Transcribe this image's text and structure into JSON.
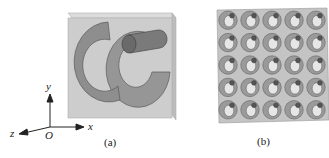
{
  "panels": [
    {
      "id": "a",
      "caption": "(a)",
      "description": "unit cell: two split-ring resonators and a cylinder in a transparent box",
      "axes": {
        "x": "x",
        "y": "y",
        "z": "z",
        "origin": "O"
      }
    },
    {
      "id": "b",
      "caption": "(b)",
      "description": "5 x 5 array of unit cells",
      "grid": {
        "rows": 5,
        "cols": 5
      }
    }
  ],
  "colors": {
    "box_fill": "#c9c9c9",
    "box_edge": "#a8a8a8",
    "ring_fill": "#8e8e8e",
    "ring_edge": "#5a5a5a",
    "cylinder_fill": "#7a7a7a",
    "cylinder_dark": "#555555",
    "axis": "#222222"
  }
}
